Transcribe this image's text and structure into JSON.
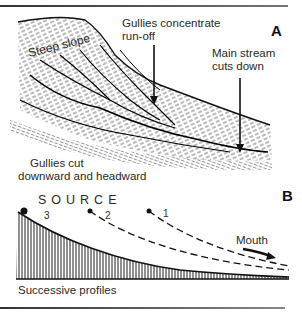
{
  "panel_a": {
    "letter": "A",
    "labels": {
      "steep_slope": "Steep slope",
      "gullies_concentrate_1": "Gullies concentrate",
      "gullies_concentrate_2": "run-off",
      "main_stream_1": "Main stream",
      "main_stream_2": "cuts down",
      "gullies_cut_1": "Gullies cut",
      "gullies_cut_2": "downward and headward"
    }
  },
  "panel_b": {
    "letter": "B",
    "source_label": "SOURCE",
    "profiles": [
      {
        "id": "3",
        "style": "solid-hatched"
      },
      {
        "id": "2",
        "style": "dashed"
      },
      {
        "id": "1",
        "style": "dashed"
      }
    ],
    "mouth_label": "Mouth",
    "caption": "Successive profiles"
  },
  "colors": {
    "ink": "#1a1a1a",
    "background": "#ffffff"
  }
}
